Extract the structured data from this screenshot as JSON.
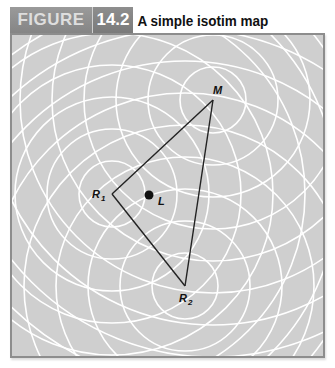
{
  "figure": {
    "label": "FIGURE",
    "number": "14.2",
    "title": "A simple isotim map"
  },
  "colors": {
    "header_label_bg": "#8c8c8c",
    "header_number_bg": "#7c7c7c",
    "map_bg": "#cfcfcf",
    "isotim_lines": "#ffffff",
    "frame_border": "#8d8d8d",
    "triangle_lines": "#222222"
  },
  "map": {
    "points": [
      {
        "id": "M",
        "label": "M",
        "subscript": "",
        "x": 201,
        "y": 65
      },
      {
        "id": "R1",
        "label": "R",
        "subscript": "1",
        "x": 100,
        "y": 159
      },
      {
        "id": "R2",
        "label": "R",
        "subscript": "2",
        "x": 173,
        "y": 251
      },
      {
        "id": "L",
        "label": "L",
        "subscript": "",
        "x": 137,
        "y": 160
      }
    ],
    "isotim_ring_spacing": 32,
    "isotim_ring_count": 9
  }
}
